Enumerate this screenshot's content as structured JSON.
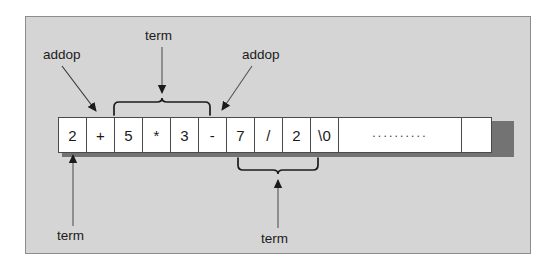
{
  "figure": {
    "type": "diagram",
    "expression": "2 + 5 * 3 - 7 / 2",
    "background_color": "#d5d5d5",
    "panel_border_color": "#8d8d8d",
    "cell_fill_color": "#ffffff",
    "cell_border_color": "#4a4a4a",
    "ink_color": "#1b1b1b"
  },
  "buffer": {
    "cells": [
      {
        "text": "2",
        "kind": "token",
        "width": "token"
      },
      {
        "text": "+",
        "kind": "token",
        "width": "token"
      },
      {
        "text": "5",
        "kind": "token",
        "width": "token"
      },
      {
        "text": "*",
        "kind": "token",
        "width": "token"
      },
      {
        "text": "3",
        "kind": "token",
        "width": "token"
      },
      {
        "text": "-",
        "kind": "token",
        "width": "token"
      },
      {
        "text": "7",
        "kind": "token",
        "width": "token"
      },
      {
        "text": "/",
        "kind": "token",
        "width": "token"
      },
      {
        "text": "2",
        "kind": "token",
        "width": "token"
      },
      {
        "text": "\\0",
        "kind": "terminator",
        "width": "token"
      },
      {
        "text": "..........",
        "kind": "ellipsis",
        "width": "wide"
      },
      {
        "text": "",
        "kind": "empty",
        "width": "tail"
      }
    ]
  },
  "annotations": {
    "addop_first": "addop",
    "term_top": "term",
    "addop_second": "addop",
    "term_bottom_left": "term",
    "term_bottom_right": "term"
  },
  "braces": {
    "top": {
      "label": "term",
      "spans_cells": "5 * 3",
      "direction": "up"
    },
    "bottom": {
      "label": "term",
      "spans_cells": "7 / 2",
      "direction": "down"
    }
  },
  "pointers": {
    "addop_first": {
      "points_to": "+",
      "direction": "down-right"
    },
    "term_top": {
      "points_to": "top-brace",
      "direction": "down"
    },
    "addop_second": {
      "points_to": "-",
      "direction": "down-left"
    },
    "term_bottom_left": {
      "points_to": "2",
      "direction": "up"
    },
    "term_bottom_right": {
      "points_to": "bottom-brace",
      "direction": "up"
    }
  }
}
